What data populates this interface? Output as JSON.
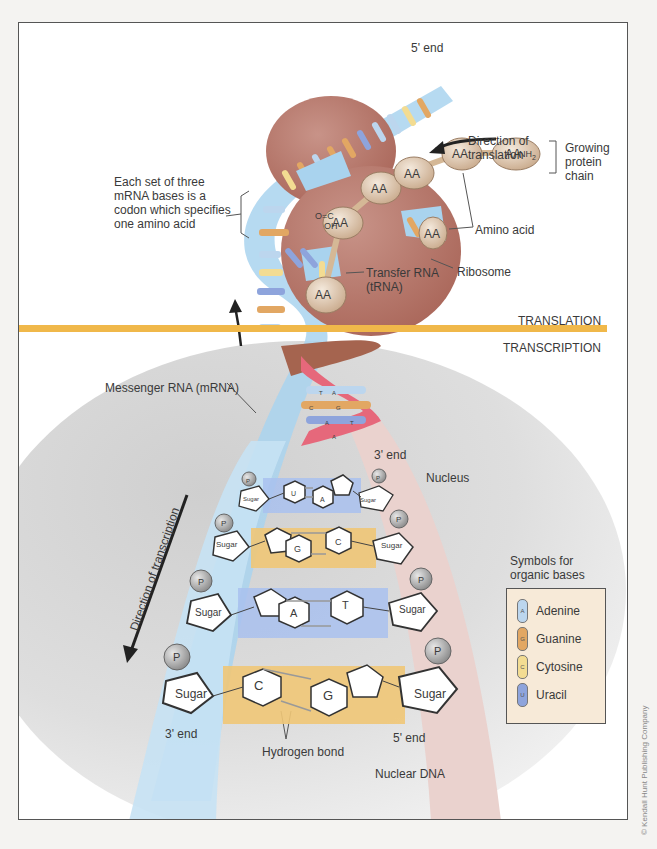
{
  "diagram": {
    "sections": {
      "translation": "TRANSLATION",
      "transcription": "TRANSCRIPTION"
    },
    "labels": {
      "five_prime_end_top": "5' end",
      "direction_translation_1": "Direction of",
      "direction_translation_2": "translation",
      "growing_chain_1": "Growing",
      "growing_chain_2": "protein",
      "growing_chain_3": "chain",
      "codon_1": "Each set of three",
      "codon_2": "mRNA bases is a",
      "codon_3": "codon which specifies",
      "codon_4": "one amino acid",
      "amino_acid": "Amino acid",
      "trna_1": "Transfer RNA",
      "trna_2": "(tRNA)",
      "ribosome": "Ribosome",
      "mrna": "Messenger RNA (mRNA)",
      "three_prime_end_dna": "3' end",
      "nucleus": "Nucleus",
      "direction_transcription": "Direction of transcription",
      "three_prime_end_bottom": "3' end",
      "five_prime_end_bottom": "5' end",
      "hydrogen_bond": "Hydrogen bond",
      "nuclear_dna": "Nuclear DNA",
      "nh2": "NH",
      "nh2_sub": "2",
      "o_c": "O=C",
      "oh": "OH"
    },
    "amino_acid_label": "AA",
    "sugar_label": "Sugar",
    "phosphate_label": "P",
    "base_pairs": [
      {
        "left": "U",
        "right": "A"
      },
      {
        "left": "G",
        "right": "C"
      },
      {
        "left": "A",
        "right": "T"
      },
      {
        "left": "C",
        "right": "G"
      }
    ],
    "helix_pairs": [
      {
        "left": "T",
        "right": "A"
      },
      {
        "left": "C",
        "right": "G"
      },
      {
        "left": "A",
        "right": "T"
      },
      {
        "left": "A",
        "right": ""
      }
    ],
    "legend": {
      "title_1": "Symbols for",
      "title_2": "organic bases",
      "items": [
        {
          "letter": "A",
          "label": "Adenine",
          "color": "#bcd6ee"
        },
        {
          "letter": "G",
          "label": "Guanine",
          "color": "#e2a763"
        },
        {
          "letter": "C",
          "label": "Cytosine",
          "color": "#f3dc92"
        },
        {
          "letter": "U",
          "label": "Uracil",
          "color": "#8ea4dc"
        }
      ]
    },
    "copyright": "© Kendall Hunt Publishing Company",
    "colors": {
      "divider": "#f0b84a",
      "ribosome": "#b7776a",
      "mrna": "#a9d3ee",
      "dna_strand": "#ead2ce",
      "nucleus": "#d8d8d8",
      "amino_acid": "#e2cdb5"
    }
  }
}
